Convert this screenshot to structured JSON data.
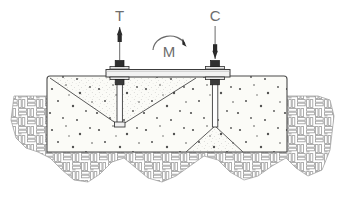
{
  "diagram": {
    "labels": {
      "tension": "T",
      "moment": "M",
      "compression": "C"
    },
    "colors": {
      "outline": "#3c3c3c",
      "soil_hatch": "#8e8e8e",
      "concrete_fill": "#fbfbf7",
      "cone_fill": "#eeeeea",
      "label_text": "#6d6d6d",
      "aggregate": "#2b2b2b",
      "plate_fill": "#f2f2f2",
      "background": "#ffffff"
    },
    "elements": {
      "base_plate": "base-plate",
      "tension_bolt": "tension-anchor-bolt",
      "compression_bolt": "compression-anchor-bolt",
      "tension_cone": "tension-breakout-cone",
      "compression_cone": "compression-bearing-cone",
      "concrete_block": "concrete-foundation-block",
      "soil": "soil-hatch-region",
      "tension_arrow": "tension-force-arrow-up",
      "compression_arrow": "compression-force-arrow-down",
      "moment_arrow": "moment-curved-arrow"
    }
  }
}
